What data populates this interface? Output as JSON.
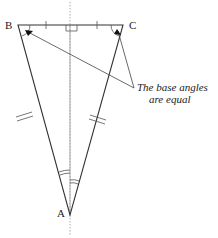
{
  "diagram": {
    "type": "isosceles-triangle",
    "vertices": {
      "A": {
        "label": "A",
        "x": 70,
        "y": 215
      },
      "B": {
        "label": "B",
        "x": 18,
        "y": 25
      },
      "C": {
        "label": "C",
        "x": 123,
        "y": 25
      }
    },
    "annotation": {
      "line1": "The base angles",
      "line2": "are equal"
    },
    "marks": {
      "right_angle_at_midpoint": true,
      "equal_half_base_ticks": 1,
      "equal_sides_ticks": 2,
      "apex_angle_arcs": 2,
      "symmetry_axis": "dotted vertical"
    },
    "colors": {
      "stroke": "#333333",
      "axis": "#888888",
      "arrow": "#111111"
    }
  }
}
